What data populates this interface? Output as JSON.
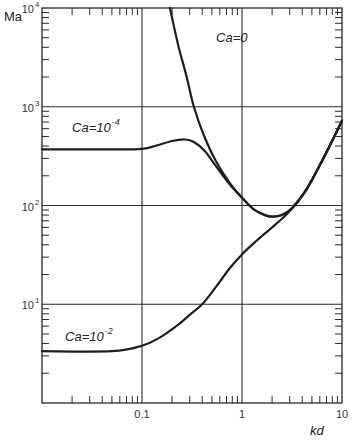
{
  "chart_data": {
    "type": "line",
    "title": "",
    "xlabel": "kd",
    "ylabel": "Ma",
    "xscale": "log",
    "yscale": "log",
    "xlim": [
      0.01,
      10
    ],
    "ylim": [
      1,
      10000
    ],
    "grid": true,
    "x_tick_labels": [
      {
        "value": 0.1,
        "label": "0.1"
      },
      {
        "value": 1,
        "label": "1"
      },
      {
        "value": 10,
        "label": "10"
      }
    ],
    "y_tick_labels": [
      {
        "value": 10,
        "base": "10",
        "exp": "1"
      },
      {
        "value": 100,
        "base": "10",
        "exp": "2"
      },
      {
        "value": 1000,
        "base": "10",
        "exp": "3"
      },
      {
        "value": 10000,
        "base": "10",
        "exp": "4"
      }
    ],
    "series": [
      {
        "name": "Ca=0",
        "label_base": "Ca=0",
        "label_exp": "",
        "label_at": {
          "x": 0.55,
          "y": 4500
        },
        "points": [
          [
            0.19,
            10000
          ],
          [
            0.23,
            4200
          ],
          [
            0.28,
            2000
          ],
          [
            0.33,
            1000
          ],
          [
            0.42,
            500
          ],
          [
            0.55,
            280
          ],
          [
            0.75,
            170
          ],
          [
            1.0,
            120
          ],
          [
            1.3,
            92
          ],
          [
            1.7,
            80
          ],
          [
            2.0,
            77
          ],
          [
            2.5,
            80
          ],
          [
            3.2,
            95
          ],
          [
            4.5,
            150
          ],
          [
            6.5,
            300
          ],
          [
            10,
            720
          ]
        ]
      },
      {
        "name": "Ca=10^-4",
        "label_base": "Ca=10",
        "label_exp": "-4",
        "label_at": {
          "x": 0.02,
          "y": 560
        },
        "points": [
          [
            0.01,
            370
          ],
          [
            0.05,
            370
          ],
          [
            0.1,
            375
          ],
          [
            0.14,
            405
          ],
          [
            0.2,
            450
          ],
          [
            0.27,
            466
          ],
          [
            0.33,
            440
          ],
          [
            0.42,
            360
          ],
          [
            0.55,
            250
          ],
          [
            0.75,
            165
          ],
          [
            1.0,
            120
          ],
          [
            1.3,
            92
          ],
          [
            1.7,
            80
          ],
          [
            2.0,
            77
          ],
          [
            2.5,
            80
          ],
          [
            3.2,
            95
          ],
          [
            4.5,
            150
          ],
          [
            6.5,
            300
          ],
          [
            10,
            720
          ]
        ]
      },
      {
        "name": "Ca=10^-2",
        "label_base": "Ca=10",
        "label_exp": "-2",
        "label_at": {
          "x": 0.017,
          "y": 4.2
        },
        "points": [
          [
            0.01,
            3.35
          ],
          [
            0.05,
            3.35
          ],
          [
            0.1,
            3.8
          ],
          [
            0.15,
            4.6
          ],
          [
            0.22,
            6.0
          ],
          [
            0.3,
            7.8
          ],
          [
            0.4,
            10
          ],
          [
            0.55,
            15
          ],
          [
            0.75,
            23
          ],
          [
            1.0,
            32
          ],
          [
            1.4,
            44
          ],
          [
            2.0,
            60
          ],
          [
            2.6,
            76
          ],
          [
            3.2,
            95
          ],
          [
            4.5,
            150
          ],
          [
            6.5,
            300
          ],
          [
            10,
            720
          ]
        ]
      }
    ]
  }
}
